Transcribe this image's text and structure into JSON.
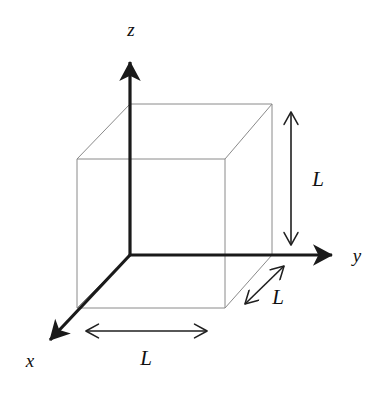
{
  "figure": {
    "background_color": "#ffffff",
    "axes": {
      "color": "#1a1a1a",
      "stroke_width": 3.2,
      "origin": {
        "x": 130,
        "y": 255
      },
      "items": [
        {
          "name": "z",
          "label": "z",
          "label_x": 131,
          "label_y": 36,
          "from_x": 130,
          "from_y": 255,
          "to_x": 130,
          "to_y": 54,
          "arrow": "end"
        },
        {
          "name": "y",
          "label": "y",
          "label_x": 357,
          "label_y": 262,
          "from_x": 130,
          "from_y": 255,
          "to_x": 341,
          "to_y": 255,
          "arrow": "end"
        },
        {
          "name": "x",
          "label": "x",
          "label_x": 30,
          "label_y": 367,
          "from_x": 130,
          "from_y": 255,
          "to_x": 43,
          "to_y": 347,
          "arrow": "end"
        }
      ]
    },
    "cube": {
      "color": "#8a8a8a",
      "stroke_width": 1,
      "front_face": {
        "left": 77,
        "top": 159,
        "right": 225,
        "bottom": 308
      },
      "back_face": {
        "left": 130,
        "top": 104,
        "right": 272,
        "bottom": 255
      },
      "vertices": {
        "front_top_left": {
          "x": 77,
          "y": 159
        },
        "front_top_right": {
          "x": 225,
          "y": 159
        },
        "front_bottom_left": {
          "x": 77,
          "y": 308
        },
        "front_bottom_right": {
          "x": 225,
          "y": 308
        },
        "back_top_left": {
          "x": 130,
          "y": 104
        },
        "back_top_right": {
          "x": 272,
          "y": 104
        },
        "back_bottom_left": {
          "x": 130,
          "y": 255
        },
        "back_bottom_right": {
          "x": 272,
          "y": 255
        }
      }
    },
    "dimensions": {
      "color": "#1f1f1f",
      "stroke_width": 1.6,
      "items": [
        {
          "name": "height",
          "label": "L",
          "label_x": 318,
          "label_y": 186,
          "from_x": 291,
          "from_y": 105,
          "to_x": 291,
          "to_y": 252,
          "arrow": "both",
          "axis": "vertical"
        },
        {
          "name": "width",
          "label": "L",
          "label_x": 146,
          "label_y": 365,
          "from_x": 79,
          "from_y": 331,
          "to_x": 214,
          "to_y": 331,
          "arrow": "both",
          "axis": "horizontal"
        },
        {
          "name": "depth",
          "label": "L",
          "label_x": 278,
          "label_y": 304,
          "from_x": 289,
          "from_y": 261,
          "to_x": 240,
          "to_y": 309,
          "arrow": "both",
          "axis": "diagonal"
        }
      ]
    }
  }
}
